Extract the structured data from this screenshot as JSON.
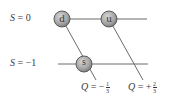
{
  "diagram": {
    "type": "quark-triangle",
    "strangeness_levels": [
      {
        "label_var": "S",
        "label_eq": " = ",
        "value": "0",
        "y": 19
      },
      {
        "label_var": "S",
        "label_eq": " = ",
        "value": "−1",
        "y": 64
      }
    ],
    "quarks": [
      {
        "name": "d",
        "label": "d",
        "cx": 62,
        "cy": 19
      },
      {
        "name": "u",
        "label": "u",
        "cx": 109,
        "cy": 19
      },
      {
        "name": "s",
        "label": "s",
        "cx": 84,
        "cy": 64
      }
    ],
    "charge_lines": [
      {
        "label_var": "Q",
        "label_eq": " = −",
        "num": "1",
        "den": "3"
      },
      {
        "label_var": "Q",
        "label_eq": " = +",
        "num": "2",
        "den": "3"
      }
    ],
    "colors": {
      "line": "#6a6a6a",
      "quark_fill": "#a8a8a8",
      "quark_stroke": "#5a5a5a",
      "text": "#3a3a3a"
    }
  }
}
